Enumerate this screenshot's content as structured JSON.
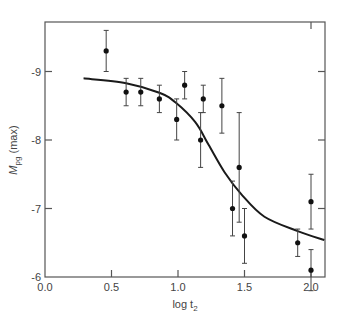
{
  "chart_data": {
    "type": "scatter",
    "title": "",
    "xlabel": "log t₂",
    "ylabel": "M_pg (max)",
    "xlim": [
      0.0,
      2.1
    ],
    "ylim": [
      -6.0,
      -9.7
    ],
    "y_inverted": true,
    "grid": false,
    "legend": null,
    "x_ticks": [
      0.0,
      0.5,
      1.0,
      1.5,
      2.0
    ],
    "x_tick_labels": [
      "0.0",
      "0.5",
      "1.0",
      "1.5",
      "2.0"
    ],
    "y_ticks": [
      -9,
      -8,
      -7,
      -6
    ],
    "y_tick_labels": [
      "-9",
      "-8",
      "-7",
      "-6"
    ],
    "series": [
      {
        "name": "observations",
        "kind": "scatter_with_errorbars",
        "points": [
          {
            "x": 0.46,
            "y": -9.3,
            "err": 0.3
          },
          {
            "x": 0.61,
            "y": -8.7,
            "err": 0.2
          },
          {
            "x": 0.72,
            "y": -8.7,
            "err": 0.2
          },
          {
            "x": 0.86,
            "y": -8.6,
            "err": 0.2
          },
          {
            "x": 0.99,
            "y": -8.3,
            "err": 0.3
          },
          {
            "x": 1.05,
            "y": -8.8,
            "err": 0.2
          },
          {
            "x": 1.17,
            "y": -8.0,
            "err": 0.4
          },
          {
            "x": 1.19,
            "y": -8.6,
            "err": 0.2
          },
          {
            "x": 1.33,
            "y": -8.5,
            "err": 0.4
          },
          {
            "x": 1.41,
            "y": -7.0,
            "err": 0.4
          },
          {
            "x": 1.46,
            "y": -7.6,
            "err": 0.8
          },
          {
            "x": 1.5,
            "y": -6.6,
            "err": 0.4
          },
          {
            "x": 1.9,
            "y": -6.5,
            "err": 0.2
          },
          {
            "x": 2.0,
            "y": -7.1,
            "err": 0.4
          },
          {
            "x": 2.0,
            "y": -6.1,
            "err": 0.3
          }
        ]
      },
      {
        "name": "fit curve",
        "kind": "line",
        "points": [
          {
            "x": 0.29,
            "y": -8.9
          },
          {
            "x": 0.61,
            "y": -8.83
          },
          {
            "x": 0.86,
            "y": -8.69
          },
          {
            "x": 0.98,
            "y": -8.55
          },
          {
            "x": 1.13,
            "y": -8.26
          },
          {
            "x": 1.23,
            "y": -7.93
          },
          {
            "x": 1.35,
            "y": -7.53
          },
          {
            "x": 1.48,
            "y": -7.2
          },
          {
            "x": 1.65,
            "y": -6.88
          },
          {
            "x": 1.9,
            "y": -6.67
          },
          {
            "x": 2.1,
            "y": -6.54
          }
        ]
      }
    ]
  },
  "axes": {
    "xlabel_main": "log t",
    "xlabel_sub": "2",
    "ylabel_main": "M",
    "ylabel_sub": "pg",
    "ylabel_suffix": " (max)"
  }
}
